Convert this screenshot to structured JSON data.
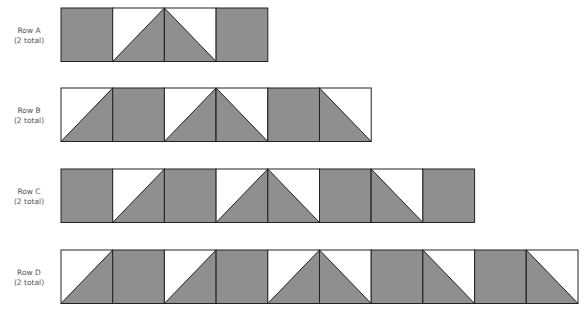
{
  "colors": {
    "gray": "#8f8f8f",
    "white": "#ffffff",
    "line": "#222222"
  },
  "square_size": 51.7,
  "rows": [
    {
      "name": "Row A",
      "count": "(2 total)",
      "top": 8,
      "label_top": 26,
      "blocks": [
        "gray",
        "up",
        "down",
        "gray"
      ]
    },
    {
      "name": "Row B",
      "count": "(2 total)",
      "top": 88,
      "label_top": 106,
      "blocks": [
        "up",
        "gray",
        "up",
        "down",
        "gray",
        "down"
      ]
    },
    {
      "name": "Row C",
      "count": "(2 total)",
      "top": 169,
      "label_top": 187,
      "blocks": [
        "gray",
        "up",
        "gray",
        "up",
        "down",
        "gray",
        "down",
        "gray"
      ]
    },
    {
      "name": "Row D",
      "count": "(2 total)",
      "top": 250,
      "label_top": 268,
      "blocks": [
        "up",
        "gray",
        "up",
        "gray",
        "up",
        "down",
        "gray",
        "down",
        "gray",
        "down"
      ]
    }
  ]
}
